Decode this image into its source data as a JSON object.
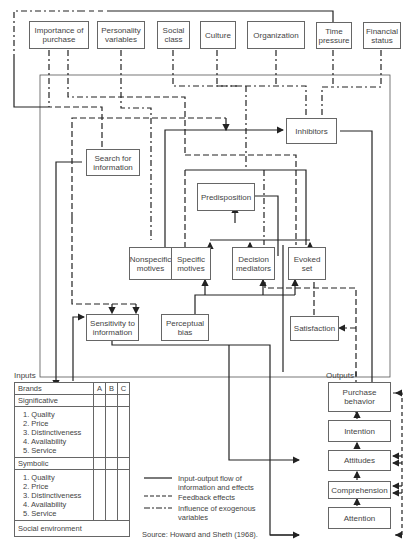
{
  "exogenous": {
    "importance": "Importance of\npurchase",
    "personality": "Personality\nvariables",
    "social_class": "Social\nclass",
    "culture": "Culture",
    "organization": "Organization",
    "time_pressure": "Time\npressure",
    "financial_status": "Financial\nstatus"
  },
  "constructs": {
    "inhibitors": "Inhibitors",
    "search": "Search for\ninformation",
    "predisposition": "Predisposition",
    "nonspecific_motives": "Nonspecific\nmotives",
    "specific_motives": "Specific\nmotives",
    "decision_mediators": "Decision\nmediators",
    "evoked_set": "Evoked\nset",
    "sensitivity": "Sensitivity to\ninformation",
    "perceptual_bias": "Perceptual\nbias",
    "satisfaction": "Satisfaction"
  },
  "inputs": {
    "label": "Inputs",
    "header": "Brands",
    "columns": [
      "A",
      "B",
      "C"
    ],
    "significative": "Significative",
    "significative_items": "1. Quality\n2. Price\n3. Distinctiveness\n4. Availability\n5. Service",
    "symbolic": "Symbolic",
    "symbolic_items": "1. Quality\n2. Price\n3. Distinctiveness\n4. Availability\n5. Service",
    "social": "Social environment"
  },
  "outputs": {
    "label": "Outputs",
    "purchase": "Purchase\nbehavior",
    "intention": "Intention",
    "attitudes": "Attitudes",
    "comprehension": "Comprehension",
    "attention": "Attention"
  },
  "legend": {
    "solid": "Input-output flow of\ninformation and effects",
    "dashed": "Feedback effects",
    "dashdot": "Influence of exogenous\nvariables"
  },
  "source": "Source:  Howard and Sheth (1968)."
}
